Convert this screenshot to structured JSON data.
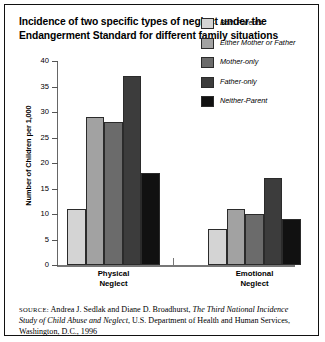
{
  "title": "Incidence of two specific types of neglect under the Endangerment Standard for different family situations",
  "source": {
    "label": "SOURCE:",
    "text_1": " Andrea J. Sedlak and Diane D. Broadhurst, ",
    "italic_1": "The Third National Incidence Study of Child Abuse and Neglect",
    "text_2": ", U.S. Department of Health and Human Services, Washington, D.C., 1996"
  },
  "legend": {
    "position": "top-right",
    "items": [
      {
        "label": "Both Parents",
        "color": "#d4d4d4"
      },
      {
        "label": "Either Mother or Father",
        "color": "#a2a2a2"
      },
      {
        "label": "Mother-only",
        "color": "#6b6b6b"
      },
      {
        "label": "Father-only",
        "color": "#3c3c3c"
      },
      {
        "label": "Neither-Parent",
        "color": "#111111"
      }
    ]
  },
  "chart_data": {
    "type": "bar",
    "title": "Incidence of two specific types of neglect under the Endangerment Standard for different family situations",
    "xlabel": "",
    "ylabel": "Number of Children per 1,000",
    "ylim": [
      0,
      40
    ],
    "yticks": [
      0,
      5,
      10,
      15,
      20,
      25,
      30,
      35,
      40
    ],
    "ytick_labels": [
      "0",
      "5",
      "10",
      "15",
      "20",
      "25",
      "30",
      "35",
      "40"
    ],
    "grid": false,
    "legend": [
      "Both Parents",
      "Either Mother or Father",
      "Mother-only",
      "Father-only",
      "Neither-Parent"
    ],
    "categories": [
      "Physical Neglect",
      "Emotional Neglect"
    ],
    "category_lines": [
      [
        "Physical",
        "Neglect"
      ],
      [
        "Emotional",
        "Neglect"
      ]
    ],
    "series": [
      {
        "name": "Both Parents",
        "color": "#d4d4d4",
        "values": [
          11,
          7
        ]
      },
      {
        "name": "Either Mother or Father",
        "color": "#a2a2a2",
        "values": [
          29,
          11
        ]
      },
      {
        "name": "Mother-only",
        "color": "#6b6b6b",
        "values": [
          28,
          10
        ]
      },
      {
        "name": "Father-only",
        "color": "#3c3c3c",
        "values": [
          37,
          17
        ]
      },
      {
        "name": "Neither-Parent",
        "color": "#111111",
        "values": [
          18,
          9
        ]
      }
    ]
  }
}
